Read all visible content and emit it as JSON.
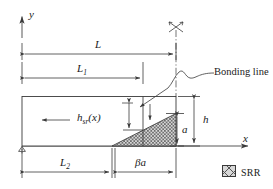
{
  "figure": {
    "background": "#ffffff",
    "line_color": "#3a3a3a",
    "text_color": "#1a1a1a",
    "hatch_color": "#555555",
    "hatch_fill": "#cfcfcf"
  },
  "axes": {
    "y_label": "y",
    "x_label": "x",
    "origin_support": "triangle-support-symbol"
  },
  "dimensions": [
    {
      "id": "L",
      "label": "L",
      "sub": "",
      "position": "top-outer",
      "description": "total length of plate"
    },
    {
      "id": "L1",
      "label": "L",
      "sub": "1",
      "position": "top-inner",
      "description": "length to section start"
    },
    {
      "id": "L2",
      "label": "L",
      "sub": "2",
      "position": "bottom-left",
      "description": "length to SRR start"
    },
    {
      "id": "beta_a",
      "label": "βa",
      "sub": "",
      "position": "bottom-right",
      "description": "SRR base width"
    },
    {
      "id": "h",
      "label": "h",
      "sub": "",
      "position": "right-outer",
      "description": "total plate thickness"
    },
    {
      "id": "a",
      "label": "a",
      "sub": "",
      "position": "right-inner",
      "description": "SRR height at bonding line"
    },
    {
      "id": "h_sr",
      "label": "h",
      "sub": "sr",
      "suffix": "(x)",
      "position": "interior",
      "description": "SRR height as function of x"
    }
  ],
  "labels": {
    "h_sr_full": "h",
    "h_sr_sub": "sr",
    "h_sr_suffix": "(x)",
    "beta_a": "βa"
  },
  "callout": {
    "text": "Bonding line",
    "leader": "curved-leader-line",
    "arrow": "arrowhead-pointing-to-bonding-line"
  },
  "markers": {
    "symmetry": "symmetry-cross-marker",
    "centerline": "dash-dot-centerline",
    "flow_arrow": "left-pointing-flow-arrow",
    "down_arrow": "downward-load-arrow"
  },
  "legend": {
    "swatch_pattern": "cross-hatch",
    "label": "SRR"
  }
}
